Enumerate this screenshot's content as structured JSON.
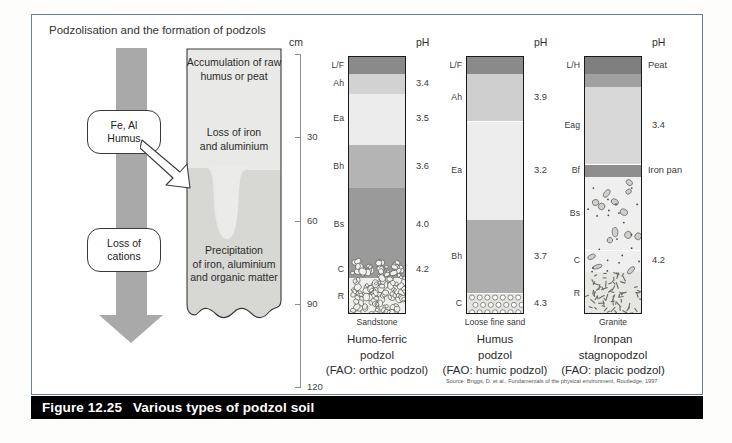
{
  "figure": {
    "number": "Figure 12.25",
    "title": "Various types of podzol soil",
    "panel_title": "Podzolisation and the formation of podzols",
    "source": "Source: Briggs, D. et al., Fundamentals of the physical environment, Routledge, 1997"
  },
  "process_diagram": {
    "arrow_label": "downward-leaching-arrow",
    "bubbles": [
      {
        "line1": "Fe, Al",
        "line2": "Humus"
      },
      {
        "line1": "Loss of",
        "line2": "cations"
      }
    ],
    "zones": [
      {
        "line1": "Accumulation of raw",
        "line2": "humus or peat"
      },
      {
        "line1": "Loss of iron",
        "line2": "and aluminium"
      },
      {
        "line1": "Precipitation",
        "line2": "of iron, aluminium",
        "line3": "and organic matter"
      }
    ]
  },
  "depth_scale": {
    "unit": "cm",
    "ticks": [
      "30",
      "60",
      "90",
      "120"
    ],
    "min": 0,
    "max": 120
  },
  "ph_header": "pH",
  "chart_data": {
    "type": "table",
    "title": "Various types of podzol soil",
    "xlabel": "",
    "ylabel": "Depth (cm)",
    "ylim": [
      0,
      120
    ],
    "grid": false,
    "legend": "none",
    "profiles": [
      {
        "name": "Humo-ferric podzol",
        "caption_line1": "Humo-ferric",
        "caption_line2": "podzol",
        "caption_line3": "(FAO: orthic podzol)",
        "substrate": "Sandstone",
        "horizons": [
          {
            "code": "L/F",
            "top_cm": 0,
            "bottom_cm": 8,
            "ph": "",
            "color": "#8a8a8a"
          },
          {
            "code": "Ah",
            "top_cm": 8,
            "bottom_cm": 17,
            "ph": "3.4",
            "color": "#d2d2d2"
          },
          {
            "code": "Ea",
            "top_cm": 17,
            "bottom_cm": 41,
            "ph": "3.5",
            "color": "#ececec"
          },
          {
            "code": "Bh",
            "top_cm": 41,
            "bottom_cm": 61,
            "ph": "3.6",
            "color": "#b4b4b4"
          },
          {
            "code": "Bs",
            "top_cm": 61,
            "bottom_cm": 95,
            "ph": "4.0",
            "color": "#9a9a9a"
          },
          {
            "code": "C",
            "top_cm": 95,
            "bottom_cm": 103,
            "ph": "4.2",
            "color": "#9a9a9a"
          },
          {
            "code": "R",
            "top_cm": 103,
            "bottom_cm": 120,
            "ph": "",
            "color": "#f0f0ec"
          }
        ]
      },
      {
        "name": "Humus podzol",
        "caption_line1": "Humus",
        "caption_line2": "podzol",
        "caption_line3": "(FAO: humic podzol)",
        "substrate": "Loose fine sand",
        "horizons": [
          {
            "code": "L/F",
            "top_cm": 0,
            "bottom_cm": 8,
            "ph": "",
            "color": "#8a8a8a"
          },
          {
            "code": "Ah",
            "top_cm": 8,
            "bottom_cm": 30,
            "ph": "3.9",
            "color": "#cfcfcf"
          },
          {
            "code": "Ea",
            "top_cm": 30,
            "bottom_cm": 76,
            "ph": "3.2",
            "color": "#ededed"
          },
          {
            "code": "Bh",
            "top_cm": 76,
            "bottom_cm": 110,
            "ph": "3.7",
            "color": "#adadad"
          },
          {
            "code": "C",
            "top_cm": 110,
            "bottom_cm": 120,
            "ph": "4.3",
            "color": "#e3e3df"
          }
        ]
      },
      {
        "name": "Ironpan stagnopodzol",
        "caption_line1": "Ironpan",
        "caption_line2": "stagnopodzol",
        "caption_line3": "(FAO: placic podzol)",
        "substrate": "Granite",
        "horizons": [
          {
            "code": "L/H",
            "top_cm": 0,
            "bottom_cm": 8,
            "ph": "",
            "color": "#7f7f7f",
            "right_label": "Peat"
          },
          {
            "code": "",
            "top_cm": 8,
            "bottom_cm": 14,
            "ph": "",
            "color": "#a0a0a0",
            "right_label": ""
          },
          {
            "code": "Eag",
            "top_cm": 14,
            "bottom_cm": 50,
            "ph": "3.4",
            "color": "#d8d8d8",
            "right_label": ""
          },
          {
            "code": "Bf",
            "top_cm": 50,
            "bottom_cm": 56,
            "ph": "",
            "color": "#8e8e8e",
            "right_label": "Iron pan"
          },
          {
            "code": "Bs",
            "top_cm": 56,
            "bottom_cm": 90,
            "ph": "",
            "color": "#efefef",
            "right_label": ""
          },
          {
            "code": "C",
            "top_cm": 90,
            "bottom_cm": 100,
            "ph": "4.2",
            "color": "#efefef",
            "right_label": ""
          },
          {
            "code": "R",
            "top_cm": 100,
            "bottom_cm": 120,
            "ph": "",
            "color": "#e6e6e2",
            "right_label": ""
          }
        ]
      }
    ]
  }
}
